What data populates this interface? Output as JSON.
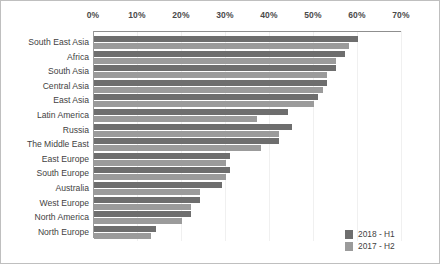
{
  "chart_data": {
    "type": "bar",
    "orientation": "horizontal",
    "title": "",
    "subtitle": "",
    "xlabel": "",
    "ylabel": "",
    "xlim": [
      0,
      70
    ],
    "xtick_labels": [
      "0%",
      "10%",
      "20%",
      "30%",
      "40%",
      "50%",
      "60%",
      "70%"
    ],
    "xticks": [
      0,
      10,
      20,
      30,
      40,
      50,
      60,
      70
    ],
    "grid": true,
    "legend_position": "bottom-right",
    "categories": [
      "South East Asia",
      "Africa",
      "South Asia",
      "Central Asia",
      "East Asia",
      "Latin America",
      "Russia",
      "The Middle East",
      "East Europe",
      "South Europe",
      "Australia",
      "West Europe",
      "North America",
      "North Europe"
    ],
    "series": [
      {
        "name": "2018 - H1",
        "color": "#6e6e6e",
        "values": [
          60,
          57,
          55,
          53,
          51,
          44,
          45,
          42,
          31,
          31,
          29,
          24,
          22,
          14
        ]
      },
      {
        "name": "2017 - H2",
        "color": "#9b9b9b",
        "values": [
          58,
          55,
          53,
          52,
          50,
          37,
          42,
          38,
          30,
          30,
          24,
          22,
          20,
          13
        ]
      }
    ]
  },
  "legend": {
    "items": [
      {
        "label": "2018 - H1"
      },
      {
        "label": "2017 - H2"
      }
    ]
  }
}
